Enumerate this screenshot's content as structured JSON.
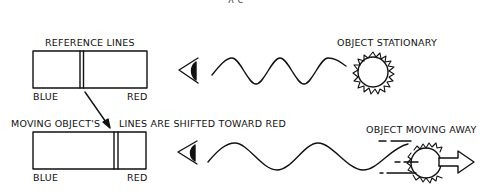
{
  "header": {
    "formula_fragment": "λ    c"
  },
  "top_panel": {
    "title": "REFERENCE LINES",
    "blue_label": "BLUE",
    "red_label": "RED",
    "object_label": "OBJECT STATIONARY"
  },
  "bottom_panel": {
    "title_left": "MOVING OBJECT'S",
    "title_right": "LINES ARE SHIFTED TOWARD RED",
    "blue_label": "BLUE",
    "red_label": "RED",
    "object_label": "OBJECT MOVING AWAY"
  },
  "colors": {
    "ink": "#111111",
    "background": "#ffffff"
  }
}
